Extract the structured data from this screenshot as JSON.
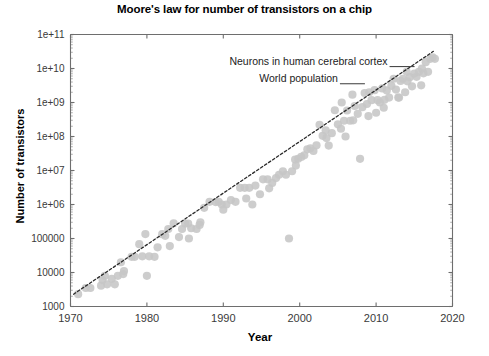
{
  "chart_data": {
    "type": "scatter",
    "title": "Moore's law for number of transistors on a chip",
    "xlabel": "Year",
    "ylabel": "Number of transistors",
    "xlim": [
      1970,
      2020
    ],
    "ylim": [
      1000,
      100000000000
    ],
    "yscale": "log",
    "grid": false,
    "legend": null,
    "xticks": [
      1970,
      1980,
      1990,
      2000,
      2010,
      2020
    ],
    "xtick_labels": [
      "1970",
      "1980",
      "1990",
      "2000",
      "2010",
      "2020"
    ],
    "yticks": [
      1000,
      10000,
      100000,
      1000000,
      10000000,
      100000000,
      1000000000,
      10000000000,
      100000000000
    ],
    "ytick_labels": [
      "1000",
      "10000",
      "100000",
      "1e+06",
      "1e+07",
      "1e+08",
      "1e+09",
      "1e+10",
      "1e+11"
    ],
    "marker_color": "#c6c6c6",
    "trendline": {
      "style": "dotted",
      "color": "#2b2b2b",
      "x": [
        1970.4,
        2017.5
      ],
      "y": [
        2300,
        32000000000
      ]
    },
    "annotations": [
      {
        "text": "Neurons in human cerebral cortex",
        "x": 2011.5,
        "y": 16000000000,
        "rule": true
      },
      {
        "text": "World population",
        "x": 2005.0,
        "y": 5000000000,
        "rule": true
      }
    ],
    "points": [
      [
        1971.0,
        2300
      ],
      [
        1972.0,
        3500
      ],
      [
        1972.6,
        3500
      ],
      [
        1974.0,
        4100
      ],
      [
        1974.2,
        6000
      ],
      [
        1974.5,
        8000
      ],
      [
        1974.8,
        4500
      ],
      [
        1975.4,
        6500
      ],
      [
        1975.8,
        4500
      ],
      [
        1976.2,
        8000
      ],
      [
        1976.6,
        20000
      ],
      [
        1976.9,
        9000
      ],
      [
        1978.0,
        29000
      ],
      [
        1978.4,
        29000
      ],
      [
        1979.0,
        68000
      ],
      [
        1979.4,
        30000
      ],
      [
        1979.8,
        135000
      ],
      [
        1980.3,
        30000
      ],
      [
        1981.4,
        55000
      ],
      [
        1982.0,
        134000
      ],
      [
        1982.4,
        120000
      ],
      [
        1982.8,
        190000
      ],
      [
        1983.5,
        280000
      ],
      [
        1984.2,
        110000
      ],
      [
        1984.6,
        190000
      ],
      [
        1985.0,
        275000
      ],
      [
        1985.4,
        275000
      ],
      [
        1985.8,
        200000
      ],
      [
        1986.5,
        190000
      ],
      [
        1986.9,
        250000
      ],
      [
        1987.5,
        800000
      ],
      [
        1988.2,
        1200000
      ],
      [
        1989.0,
        1180000
      ],
      [
        1989.4,
        1200000
      ],
      [
        1989.8,
        1000000
      ],
      [
        1990.4,
        1000000
      ],
      [
        1991.0,
        1350000
      ],
      [
        1991.6,
        1200000
      ],
      [
        1992.2,
        3100000
      ],
      [
        1992.8,
        3100000
      ],
      [
        1993.4,
        3100000
      ],
      [
        1993.8,
        1000000
      ],
      [
        1994.2,
        3600000
      ],
      [
        1994.8,
        2000000
      ],
      [
        1995.2,
        5500000
      ],
      [
        1995.8,
        5500000
      ],
      [
        1996.4,
        4300000
      ],
      [
        1996.9,
        6000000
      ],
      [
        1997.3,
        7500000
      ],
      [
        1997.8,
        9500000
      ],
      [
        1998.2,
        7500000
      ],
      [
        1998.6,
        100000
      ],
      [
        1999.0,
        9500000
      ],
      [
        1999.4,
        21000000
      ],
      [
        1999.8,
        22000000
      ],
      [
        2000.2,
        25000000
      ],
      [
        2000.6,
        28000000
      ],
      [
        2001.0,
        42000000
      ],
      [
        2001.4,
        45000000
      ],
      [
        2001.8,
        37500000
      ],
      [
        2002.2,
        55000000
      ],
      [
        2002.6,
        220000000
      ],
      [
        2003.0,
        105000000
      ],
      [
        2003.4,
        152000000
      ],
      [
        2003.8,
        54000000
      ],
      [
        2004.2,
        125000000
      ],
      [
        2004.6,
        592000000
      ],
      [
        2005.0,
        228000000
      ],
      [
        2005.4,
        169000000
      ],
      [
        2005.8,
        291000000
      ],
      [
        2006.2,
        582000000
      ],
      [
        2006.6,
        291000000
      ],
      [
        2006.9,
        1700000000
      ],
      [
        2007.2,
        789000000
      ],
      [
        2007.6,
        463000000
      ],
      [
        2007.9,
        22000000
      ],
      [
        2008.2,
        731000000
      ],
      [
        2008.5,
        1900000000
      ],
      [
        2008.8,
        904000000
      ],
      [
        2009.1,
        2000000000
      ],
      [
        2009.4,
        1170000000
      ],
      [
        2009.8,
        2300000000
      ],
      [
        2010.2,
        1170000000
      ],
      [
        2010.5,
        1000000000
      ],
      [
        2010.8,
        2600000000
      ],
      [
        2011.1,
        1200000000
      ],
      [
        2011.4,
        2270000000
      ],
      [
        2011.7,
        1400000000
      ],
      [
        2012.0,
        3100000000
      ],
      [
        2012.3,
        5000000000
      ],
      [
        2012.6,
        2400000000
      ],
      [
        2012.9,
        1400000000
      ],
      [
        2013.2,
        4310000000
      ],
      [
        2013.5,
        5000000000
      ],
      [
        2013.8,
        2000000000
      ],
      [
        2014.1,
        4200000000
      ],
      [
        2014.4,
        5560000000
      ],
      [
        2014.7,
        3000000000
      ],
      [
        2015.0,
        7100000000
      ],
      [
        2015.3,
        5700000000
      ],
      [
        2015.6,
        8000000000
      ],
      [
        2015.9,
        3200000000
      ],
      [
        2016.2,
        7200000000
      ],
      [
        2016.5,
        15300000000
      ],
      [
        2016.8,
        8000000000
      ],
      [
        2017.1,
        19200000000
      ],
      [
        2017.4,
        21100000000
      ],
      [
        2017.7,
        19200000000
      ],
      [
        2006.0,
        100000000
      ],
      [
        2007.0,
        300000000
      ],
      [
        2009.0,
        400000000
      ],
      [
        2010.0,
        500000000
      ],
      [
        2011.0,
        700000000
      ],
      [
        1987.0,
        300000
      ],
      [
        1990.0,
        700000
      ],
      [
        1993.0,
        1500000
      ],
      [
        1996.0,
        3000000
      ],
      [
        1999.5,
        14000000
      ],
      [
        2003.5,
        90000000
      ],
      [
        2013.0,
        1400000000
      ],
      [
        2016.0,
        10000000000
      ],
      [
        2014.0,
        8000000000
      ],
      [
        1981.0,
        29000
      ],
      [
        1985.5,
        100000
      ],
      [
        1977.0,
        11000
      ],
      [
        1980.0,
        8000
      ],
      [
        1983.0,
        60000
      ],
      [
        2005.5,
        1000000000
      ]
    ]
  }
}
